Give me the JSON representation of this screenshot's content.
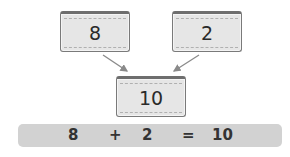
{
  "cards": {
    "left": {
      "value": "8"
    },
    "right": {
      "value": "2"
    },
    "result": {
      "value": "10"
    }
  },
  "equation": {
    "a": "8",
    "op": "+",
    "b": "2",
    "eq": "=",
    "result": "10"
  },
  "colors": {
    "card_fill": "#e6e6e6",
    "card_border": "#7a7a7a",
    "arrow": "#8a8a8a",
    "equation_bg": "#d2d2d2"
  }
}
